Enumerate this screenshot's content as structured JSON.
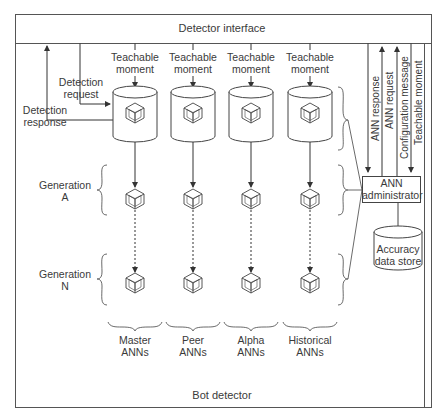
{
  "diagram": {
    "outer_label": "Bot detector",
    "interface_label": "Detector interface",
    "left_arrows": {
      "detection_request": [
        "Detection",
        "request"
      ],
      "detection_response": [
        "Detection",
        "response"
      ]
    },
    "columns": [
      {
        "top": [
          "Teachable",
          "moment"
        ],
        "bottom": [
          "Master",
          "ANNs"
        ]
      },
      {
        "top": [
          "Teachable",
          "moment"
        ],
        "bottom": [
          "Peer",
          "ANNs"
        ]
      },
      {
        "top": [
          "Teachable",
          "moment"
        ],
        "bottom": [
          "Alpha",
          "ANNs"
        ]
      },
      {
        "top": [
          "Teachable",
          "moment"
        ],
        "bottom": [
          "Historical",
          "ANNs"
        ]
      }
    ],
    "generations": [
      {
        "line1": "Generation",
        "line2": "A"
      },
      {
        "line1": "Generation",
        "line2": "N"
      }
    ],
    "right_messages": [
      "ANN response",
      "ANN request",
      "Configuration message",
      "Teachable moment"
    ],
    "administrator": [
      "ANN",
      "administrator"
    ],
    "data_store": [
      "Accuracy",
      "data store"
    ]
  }
}
